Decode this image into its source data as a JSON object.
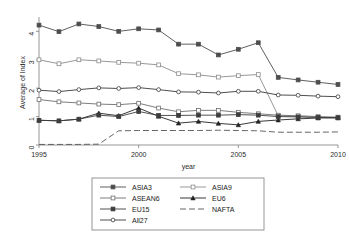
{
  "chart_data": {
    "type": "line",
    "title": "",
    "subtitle": "",
    "xlabel": "year",
    "ylabel": "Average of Index",
    "xlim": [
      1995,
      2010
    ],
    "ylim": [
      0,
      4.4
    ],
    "xticks": [
      "1995",
      "2000",
      "2005",
      "2010"
    ],
    "xtick_values": [
      1995,
      2000,
      2005,
      2010
    ],
    "yticks": [
      "0",
      "1",
      "2",
      "3",
      "4"
    ],
    "ytick_values": [
      0,
      1,
      2,
      3,
      4
    ],
    "grid": false,
    "legend_position": "bottom",
    "x": [
      1995,
      1996,
      1997,
      1998,
      1999,
      2000,
      2001,
      2002,
      2003,
      2004,
      2005,
      2006,
      2007,
      2008,
      2009,
      2010
    ],
    "series": [
      {
        "name": "ASIA3",
        "marker": "filled-square",
        "dash": "solid",
        "color": "#4d4d4d",
        "values": [
          4.22,
          3.99,
          4.26,
          4.17,
          4.0,
          4.09,
          4.05,
          3.55,
          3.55,
          3.17,
          3.37,
          3.6,
          2.38,
          2.29,
          2.21,
          2.13
        ]
      },
      {
        "name": "ASIA9",
        "marker": "open-square",
        "dash": "solid",
        "color": "#8c8c8c",
        "values": [
          3.0,
          2.86,
          3.0,
          2.96,
          2.91,
          2.88,
          2.82,
          2.51,
          2.47,
          2.39,
          2.44,
          2.48,
          1.03,
          1.0,
          0.97,
          0.95
        ]
      },
      {
        "name": "ASEAN6",
        "marker": "open-square",
        "dash": "solid",
        "color": "#6e6e6e",
        "values": [
          1.6,
          1.52,
          1.48,
          1.44,
          1.42,
          1.47,
          1.3,
          1.17,
          1.22,
          1.22,
          1.15,
          1.1,
          1.05,
          1.03,
          1.0,
          0.98
        ]
      },
      {
        "name": "EU6",
        "marker": "filled-triangle",
        "dash": "solid",
        "color": "#222222",
        "values": [
          0.87,
          0.85,
          0.91,
          1.12,
          1.03,
          1.3,
          1.01,
          0.77,
          0.83,
          0.76,
          0.71,
          0.83,
          0.88,
          0.92,
          0.95,
          0.96
        ]
      },
      {
        "name": "EU15",
        "marker": "filled-square",
        "dash": "solid",
        "color": "#3d3d3d",
        "values": [
          0.87,
          0.85,
          0.91,
          1.05,
          1.0,
          1.18,
          1.04,
          1.04,
          1.05,
          1.05,
          1.07,
          1.05,
          1.0,
          0.99,
          0.97,
          0.96
        ]
      },
      {
        "name": "All27",
        "marker": "open-circle",
        "dash": "solid",
        "color": "#3a3a3a",
        "values": [
          1.93,
          1.88,
          1.95,
          2.01,
          1.99,
          2.02,
          1.95,
          1.87,
          1.86,
          1.83,
          1.89,
          1.89,
          1.76,
          1.75,
          1.72,
          1.7
        ]
      },
      {
        "name": "NAFTA",
        "marker": "none",
        "dash": "dashed",
        "color": "#555555",
        "values": [
          0.02,
          0.02,
          0.02,
          0.03,
          0.5,
          0.51,
          0.51,
          0.51,
          0.51,
          0.52,
          0.51,
          0.5,
          0.45,
          0.45,
          0.45,
          0.46
        ]
      }
    ]
  },
  "axes": {
    "y_title": "Average of Index",
    "x_title": "year"
  },
  "legend": {
    "entries": [
      {
        "label": "ASIA3",
        "series": "ASIA3"
      },
      {
        "label": "ASIA9",
        "series": "ASIA9"
      },
      {
        "label": "ASEAN6",
        "series": "ASEAN6"
      },
      {
        "label": "EU6",
        "series": "EU6"
      },
      {
        "label": "EU15",
        "series": "EU15"
      },
      {
        "label": "NAFTA",
        "series": "NAFTA"
      },
      {
        "label": "All27",
        "series": "All27"
      }
    ]
  },
  "colors": {
    "background": "#ffffff",
    "axis": "#8a8a8a",
    "text": "#1a1a1a"
  }
}
